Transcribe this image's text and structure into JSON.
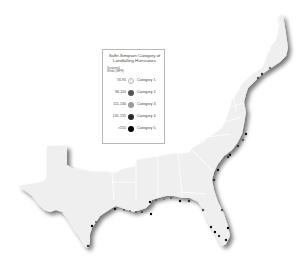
{
  "legend": {
    "title": "Saffir-Simpson Category of Landfalling Hurricanes",
    "title_line1": "Saffir-Simpson Category of",
    "title_line2": "Landfalling Hurricanes",
    "subtitle_line1": "Sustained",
    "subtitle_line2": "Winds (MPH)",
    "items": [
      {
        "range": "74-95",
        "label": "Category 1",
        "color": "#f2f2f2"
      },
      {
        "range": "96-110",
        "label": "Category 2",
        "color": "#555555"
      },
      {
        "range": "111-130",
        "label": "Category 3",
        "color": "#9a9a9a"
      },
      {
        "range": "131-155",
        "label": "Category 4",
        "color": "#2a2a2a"
      },
      {
        "range": ">155",
        "label": "Category 5",
        "color": "#000000"
      }
    ]
  },
  "map": {
    "region": "Eastern and Gulf Coast United States",
    "land_color": "#efefef",
    "border_color": "#ffffff",
    "shadow_color": "#9a9a9a"
  }
}
